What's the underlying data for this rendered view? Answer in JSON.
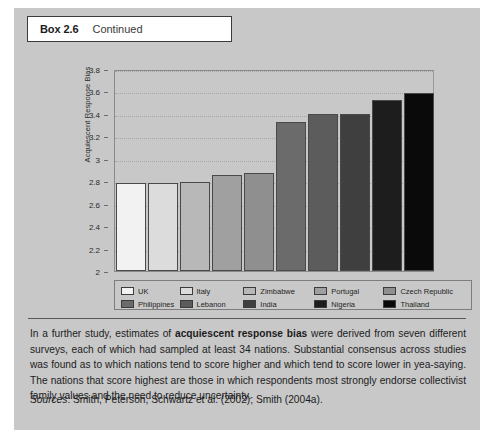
{
  "box": {
    "number": "Box 2.6",
    "continued_label": "Continued"
  },
  "chart_data": {
    "type": "bar",
    "title": "",
    "xlabel": "",
    "ylabel": "Acquiescent Response Bias",
    "ylim": [
      2,
      3.8
    ],
    "y_ticks": [
      "2",
      "2.2",
      "2.4",
      "2.6",
      "2.8",
      "3",
      "3.2",
      "3.4",
      "3.6",
      "3.8"
    ],
    "grid": true,
    "legend_position": "bottom",
    "categories": [
      "UK",
      "Italy",
      "Zimbabwe",
      "Portugal",
      "Czech Republic",
      "Philippines",
      "Lebanon",
      "India",
      "Nigeria",
      "Thailand"
    ],
    "values": [
      2.78,
      2.78,
      2.79,
      2.86,
      2.87,
      3.33,
      3.4,
      3.4,
      3.52,
      3.59
    ],
    "colors": [
      "#f2f2f2",
      "#dcdcdc",
      "#b8b8b8",
      "#a0a0a0",
      "#8f8f8f",
      "#6b6b6b",
      "#5c5c5c",
      "#3f3f3f",
      "#1d1d1d",
      "#0a0a0a"
    ],
    "legend": [
      {
        "label": "UK",
        "color": "#f2f2f2"
      },
      {
        "label": "Italy",
        "color": "#dcdcdc"
      },
      {
        "label": "Zimbabwe",
        "color": "#b8b8b8"
      },
      {
        "label": "Portugal",
        "color": "#a0a0a0"
      },
      {
        "label": "Czech Republic",
        "color": "#8f8f8f"
      },
      {
        "label": "Philippines",
        "color": "#6b6b6b"
      },
      {
        "label": "Lebanon",
        "color": "#5c5c5c"
      },
      {
        "label": "India",
        "color": "#3f3f3f"
      },
      {
        "label": "Nigeria",
        "color": "#1d1d1d"
      },
      {
        "label": "Thailand",
        "color": "#0a0a0a"
      }
    ]
  },
  "body": {
    "paragraph_part1": "In a further study, estimates of ",
    "paragraph_emphasis": "acquiescent response bias",
    "paragraph_part2": " were derived from seven different surveys, each of which had sampled at least 34 nations. Substantial consensus across studies was found as to which nations tend to score higher and which tend to score lower in yea-saying. The nations that score highest are those in which respondents most strongly endorse collectivist family values and the need to reduce uncertainty."
  },
  "sources": {
    "label": "Sources",
    "text": ": Smith, Peterson, Schwartz et al. (2002); Smith (2004a)."
  }
}
